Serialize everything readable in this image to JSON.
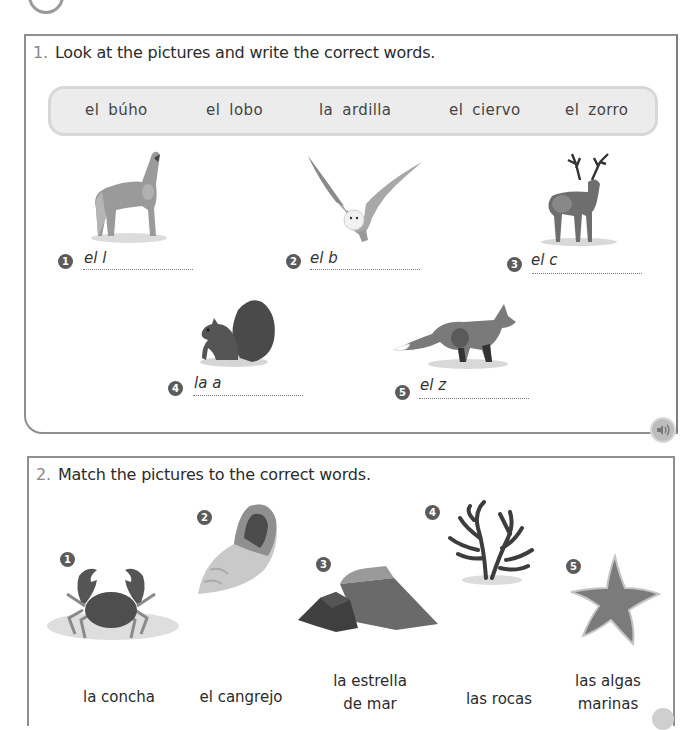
{
  "exercise1": {
    "number": "1.",
    "instruction": "Look at the pictures and write the correct words.",
    "word_bank": [
      "el búho",
      "el lobo",
      "la ardilla",
      "el ciervo",
      "el zorro"
    ],
    "items": [
      {
        "number": "1",
        "animal": "wolf",
        "prompt": "el l"
      },
      {
        "number": "2",
        "animal": "owl",
        "prompt": "el b"
      },
      {
        "number": "3",
        "animal": "deer",
        "prompt": "el c"
      },
      {
        "number": "4",
        "animal": "squirrel",
        "prompt": "la a"
      },
      {
        "number": "5",
        "animal": "fox",
        "prompt": "el z"
      }
    ],
    "audio_icon": "speaker-icon"
  },
  "exercise2": {
    "number": "2.",
    "instruction": "Match the pictures to the correct words.",
    "pictures": [
      {
        "number": "1",
        "subject": "crab"
      },
      {
        "number": "2",
        "subject": "shell"
      },
      {
        "number": "3",
        "subject": "rocks"
      },
      {
        "number": "4",
        "subject": "seaweed"
      },
      {
        "number": "5",
        "subject": "starfish"
      }
    ],
    "words": [
      {
        "line1": "la concha",
        "line2": ""
      },
      {
        "line1": "el cangrejo",
        "line2": ""
      },
      {
        "line1": "la estrella",
        "line2": "de mar"
      },
      {
        "line1": "las rocas",
        "line2": ""
      },
      {
        "line1": "las algas",
        "line2": "marinas"
      }
    ]
  }
}
